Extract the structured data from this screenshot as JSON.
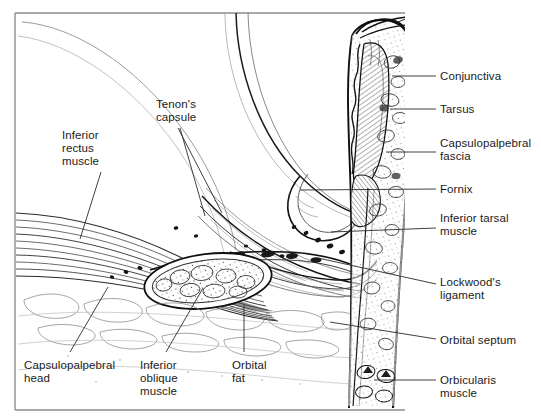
{
  "figure": {
    "frame_color": "#8a8a8a",
    "ink_color": "#111111",
    "background": "#ffffff",
    "text_color": "#1a1a1a"
  },
  "labels_right": [
    {
      "id": "conjunctiva",
      "text": "Conjunctiva",
      "x": 440,
      "y": 70,
      "leader": {
        "x1": 392,
        "y1": 76,
        "x2": 436,
        "y2": 76
      }
    },
    {
      "id": "tarsus",
      "text": "Tarsus",
      "x": 440,
      "y": 103,
      "leader": {
        "x1": 390,
        "y1": 109,
        "x2": 436,
        "y2": 109
      }
    },
    {
      "id": "capsulopalpebral-fascia",
      "text": "Capsulopalpebral\nfascia",
      "x": 440,
      "y": 137,
      "leader": {
        "x1": 386,
        "y1": 152,
        "x2": 436,
        "y2": 152
      }
    },
    {
      "id": "fornix",
      "text": "Fornix",
      "x": 440,
      "y": 183,
      "leader": {
        "x1": 300,
        "y1": 190,
        "x2": 436,
        "y2": 189
      }
    },
    {
      "id": "inferior-tarsal-muscle",
      "text": "Inferior tarsal\nmuscle",
      "x": 440,
      "y": 212,
      "leader": {
        "x1": 331,
        "y1": 232,
        "x2": 436,
        "y2": 228
      }
    },
    {
      "id": "lockwoods-ligament",
      "text": "Lockwood's\nligament",
      "x": 440,
      "y": 276,
      "leader": {
        "x1": 318,
        "y1": 258,
        "x2": 436,
        "y2": 284
      }
    },
    {
      "id": "orbital-septum",
      "text": "Orbital septum",
      "x": 440,
      "y": 334,
      "leader": {
        "x1": 330,
        "y1": 322,
        "x2": 436,
        "y2": 339
      }
    },
    {
      "id": "orbicularis-muscle",
      "text": "Orbicularis\nmuscle",
      "x": 440,
      "y": 374,
      "leader": {
        "x1": 374,
        "y1": 380,
        "x2": 436,
        "y2": 380
      }
    }
  ],
  "labels_left": [
    {
      "id": "inferior-rectus-muscle",
      "text": "Inferior\nrectus\nmuscle",
      "x": 62,
      "y": 129,
      "leader": {
        "x1": 101,
        "y1": 172,
        "x2": 80,
        "y2": 239
      }
    },
    {
      "id": "tenons-capsule",
      "text": "Tenon's\ncapsule",
      "x": 156,
      "y": 98,
      "leader": {
        "x1": 178,
        "y1": 128,
        "x2": 222,
        "y2": 213
      }
    },
    {
      "id": "tenons-capsule-2",
      "text": "",
      "x": 0,
      "y": 0,
      "leader": {
        "x1": 180,
        "y1": 128,
        "x2": 205,
        "y2": 216
      }
    },
    {
      "id": "capsulopalpebral-head",
      "text": "Capsulopalpebral\nhead",
      "x": 24,
      "y": 359,
      "leader": {
        "x1": 70,
        "y1": 352,
        "x2": 108,
        "y2": 287
      }
    },
    {
      "id": "inferior-oblique-muscle",
      "text": "Inferior\noblique\nmuscle",
      "x": 140,
      "y": 359,
      "leader": {
        "x1": 166,
        "y1": 352,
        "x2": 203,
        "y2": 288
      }
    },
    {
      "id": "orbital-fat",
      "text": "Orbital\nfat",
      "x": 232,
      "y": 359,
      "leader": {
        "x1": 244,
        "y1": 352,
        "x2": 244,
        "y2": 305
      }
    }
  ],
  "anatomy_parts": [
    "globe-sclera",
    "inferior-rectus-muscle-fibers",
    "tenons-capsule-sheath",
    "capsulopalpebral-fascia-band",
    "inferior-oblique-muscle-cross-section",
    "lockwoods-ligament-band",
    "orbital-fat-lobules",
    "conjunctival-fornix",
    "tarsal-plate",
    "inferior-tarsal-muscle",
    "orbital-septum",
    "orbicularis-muscle",
    "eyelid-margin",
    "eyelashes",
    "eyelid-skin"
  ]
}
